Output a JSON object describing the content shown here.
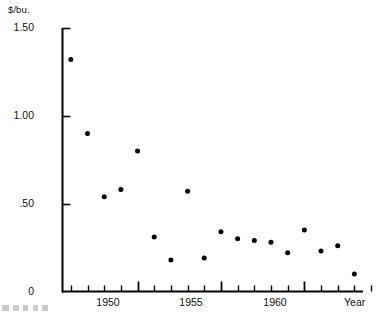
{
  "chart_data": {
    "type": "scatter",
    "title": "",
    "subtitle": "",
    "xlabel": "Year",
    "ylabel": "$/bu.",
    "y_unit_label": "$/bu.",
    "xlim": [
      1945.5,
      1964.5
    ],
    "ylim": [
      0,
      1.5
    ],
    "grid": false,
    "legend": null,
    "y_ticks": [
      {
        "value": 1.5,
        "label": "1.50"
      },
      {
        "value": 1.0,
        "label": "1.00"
      },
      {
        "value": 0.5,
        "label": ".50"
      },
      {
        "value": 0.0,
        "label": "0"
      }
    ],
    "x_ticks_major": [
      {
        "value": 1950,
        "label": "1950"
      },
      {
        "value": 1955,
        "label": "1955"
      },
      {
        "value": 1960,
        "label": "1960"
      }
    ],
    "x_ticks_minor": [
      1946,
      1947,
      1948,
      1949,
      1951,
      1952,
      1953,
      1954,
      1956,
      1957,
      1958,
      1959,
      1961,
      1962,
      1963,
      1964
    ],
    "x": [
      1946,
      1947,
      1948,
      1949,
      1950,
      1951,
      1952,
      1953,
      1954,
      1955,
      1956,
      1957,
      1958,
      1959,
      1960,
      1961,
      1962,
      1963
    ],
    "values": [
      1.32,
      0.9,
      0.54,
      0.58,
      0.8,
      0.31,
      0.18,
      0.57,
      0.19,
      0.34,
      0.3,
      0.29,
      0.28,
      0.22,
      0.35,
      0.23,
      0.26,
      0.1
    ],
    "points": [
      {
        "x": 1946,
        "y": 1.32
      },
      {
        "x": 1947,
        "y": 0.9
      },
      {
        "x": 1948,
        "y": 0.54
      },
      {
        "x": 1949,
        "y": 0.58
      },
      {
        "x": 1950,
        "y": 0.8
      },
      {
        "x": 1951,
        "y": 0.31
      },
      {
        "x": 1952,
        "y": 0.18
      },
      {
        "x": 1953,
        "y": 0.57
      },
      {
        "x": 1954,
        "y": 0.19
      },
      {
        "x": 1955,
        "y": 0.34
      },
      {
        "x": 1956,
        "y": 0.3
      },
      {
        "x": 1957,
        "y": 0.29
      },
      {
        "x": 1958,
        "y": 0.28
      },
      {
        "x": 1959,
        "y": 0.22
      },
      {
        "x": 1960,
        "y": 0.35
      },
      {
        "x": 1961,
        "y": 0.23
      },
      {
        "x": 1962,
        "y": 0.26
      },
      {
        "x": 1963,
        "y": 0.1
      }
    ],
    "marker": {
      "shape": "circle",
      "color": "#000000",
      "size": 5
    },
    "axis_color": "#000000"
  },
  "axes": {
    "y_unit": "$/bu.",
    "y_tick_labels": [
      "1.50",
      "1.00",
      ".50",
      "0"
    ],
    "x_tick_labels": [
      "1950",
      "1955",
      "1960"
    ],
    "x_axis_title": "Year"
  }
}
